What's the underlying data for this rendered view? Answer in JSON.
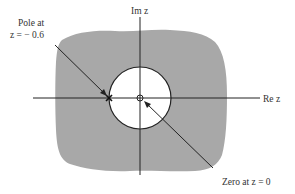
{
  "diagram": {
    "type": "z-plane pole-zero plot with region of convergence",
    "axes": {
      "real_label": "Re z",
      "imag_label": "Im z"
    },
    "unit_circle": {
      "present": true
    },
    "region_of_convergence": {
      "shaded": true,
      "color": "#a8a8a8",
      "description": "exterior of circle |z| > 0.6"
    },
    "pole": {
      "label_line1": "Pole at",
      "label_line2": "z = − 0.6",
      "location": -0.6,
      "marker": "×"
    },
    "zero": {
      "label": "Zero at z = 0",
      "location": 0,
      "marker": "o"
    },
    "colors": {
      "shade": "#a8a8a8",
      "line": "#222222",
      "text": "#333333",
      "background": "#ffffff"
    }
  }
}
